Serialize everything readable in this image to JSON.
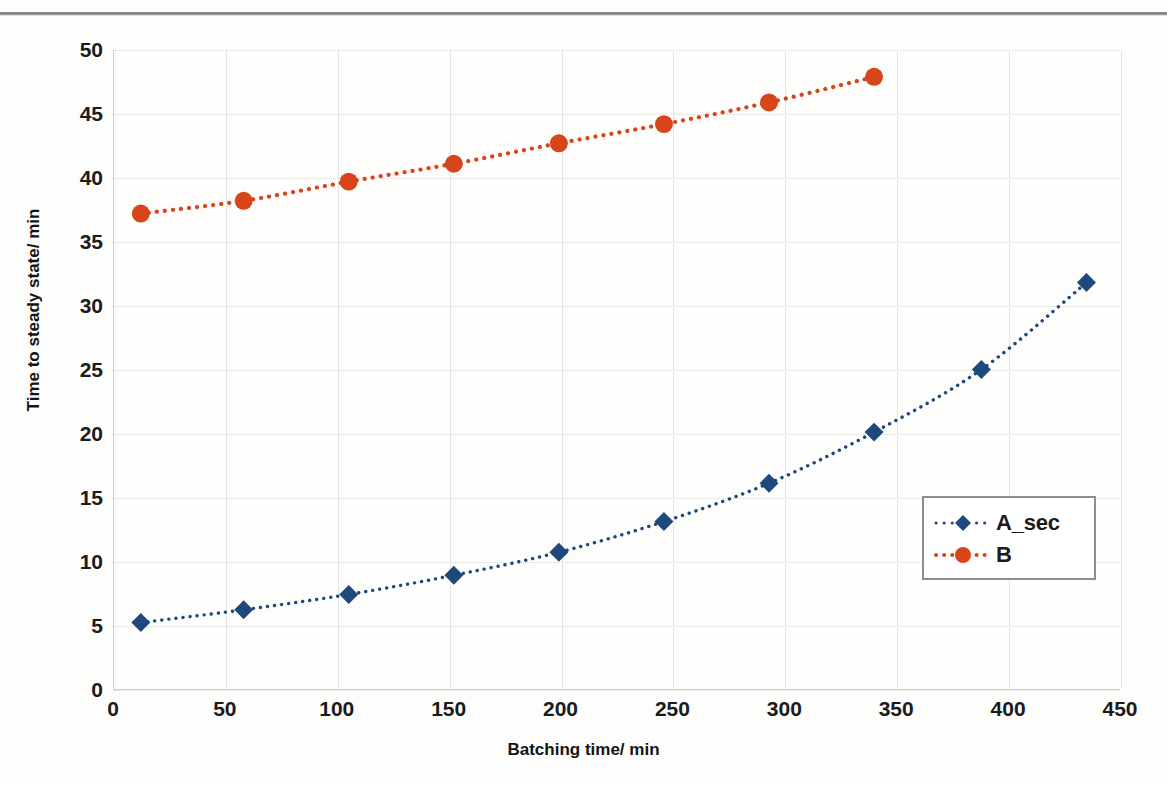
{
  "chart_data": {
    "type": "line",
    "title": "",
    "xlabel": "Batching time/ min",
    "ylabel": "Time to steady state/ min",
    "xlim": [
      0,
      450
    ],
    "ylim": [
      0,
      50
    ],
    "xticks": [
      "0",
      "50",
      "100",
      "150",
      "200",
      "250",
      "300",
      "350",
      "400",
      "450"
    ],
    "yticks": [
      "0",
      "5",
      "10",
      "15",
      "20",
      "25",
      "30",
      "35",
      "40",
      "45",
      "50"
    ],
    "xtick_step": 50,
    "ytick_step": 5,
    "grid": "both",
    "legend_position": "center-right",
    "series": [
      {
        "name": "A_sec",
        "color": "#1F497D",
        "marker": "diamond",
        "linestyle": "dotted",
        "x": [
          12,
          58,
          105,
          152,
          199,
          246,
          293,
          340,
          388,
          435
        ],
        "values": [
          5.2,
          6.2,
          7.4,
          8.9,
          10.7,
          13.1,
          16.1,
          20.1,
          25.0,
          31.8
        ]
      },
      {
        "name": "B",
        "color": "#D9451B",
        "marker": "circle",
        "linestyle": "dotted",
        "x": [
          12,
          58,
          105,
          152,
          199,
          246,
          293,
          340
        ],
        "values": [
          37.2,
          38.2,
          39.7,
          41.1,
          42.7,
          44.2,
          45.9,
          47.9
        ]
      }
    ]
  },
  "legend": {
    "entries": [
      {
        "label": "A_sec",
        "color": "#1F497D"
      },
      {
        "label": "B",
        "color": "#D9451B"
      }
    ]
  }
}
